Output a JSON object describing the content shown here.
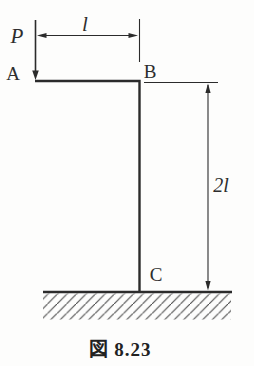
{
  "figure": {
    "labels": {
      "force": "P",
      "point_a": "A",
      "point_b": "B",
      "point_c": "C",
      "dim_top": "l",
      "dim_right": "2l"
    },
    "caption": "図 8.23",
    "colors": {
      "line": "#2b2b2b",
      "hatch": "#4a4a4a",
      "background": "#fdfdfc"
    }
  }
}
